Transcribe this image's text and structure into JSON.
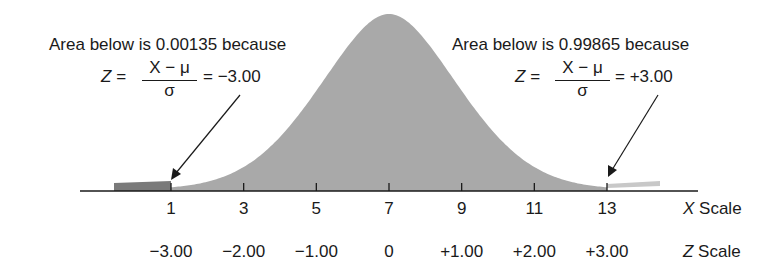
{
  "chart_data": {
    "type": "area",
    "title": "",
    "mean": 7,
    "std_dev": 2,
    "x_scale": {
      "label_italic": "X",
      "label_rest": " Scale",
      "ticks": [
        1,
        3,
        5,
        7,
        9,
        11,
        13
      ],
      "tick_labels": [
        "1",
        "3",
        "5",
        "7",
        "9",
        "11",
        "13"
      ]
    },
    "z_scale": {
      "label_italic": "Z",
      "label_rest": " Scale",
      "ticks": [
        -3,
        -2,
        -1,
        0,
        1,
        2,
        3
      ],
      "tick_labels": [
        "−3.00",
        "−2.00",
        "−1.00",
        "0",
        "+1.00",
        "+2.00",
        "+3.00"
      ]
    },
    "annotations": [
      {
        "text": "Area below is 0.00135 because",
        "formula_lhs": "Z =",
        "formula_num": "X − μ",
        "formula_den": "σ",
        "formula_rhs": "= −3.00",
        "points_to_x": 1,
        "area": 0.00135,
        "z": -3.0
      },
      {
        "text": "Area below is 0.99865 because",
        "formula_lhs": "Z =",
        "formula_num": "X − μ",
        "formula_den": "σ",
        "formula_rhs": "= +3.00",
        "points_to_x": 13,
        "area": 0.99865,
        "z": 3.0
      }
    ],
    "shaded_regions": [
      {
        "from_x": "-inf",
        "to_x": 1,
        "color": "#7a7a7a",
        "meaning": "area below Z=-3.00"
      },
      {
        "from_x": 1,
        "to_x": 13,
        "color": "#a9a9a9",
        "meaning": "main body"
      },
      {
        "from_x": 13,
        "to_x": "+inf",
        "color": "#c8c8c8",
        "meaning": "upper tail (unshaded)"
      }
    ]
  },
  "colors": {
    "curve_fill": "#a9a9a9",
    "left_tail_fill": "#7a7a7a",
    "right_tail_fill": "#c8c8c8",
    "axis": "#1a1a1a",
    "text": "#1a1a1a"
  }
}
